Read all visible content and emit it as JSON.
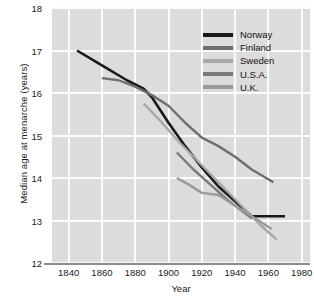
{
  "chart_data": {
    "type": "line",
    "title": "",
    "xlabel": "Year",
    "ylabel": "Median age at menarche (years)",
    "xlim": [
      1830,
      1985
    ],
    "ylim": [
      12,
      18
    ],
    "grid": true,
    "legend_position": "top-right",
    "xticks": [
      1840,
      1860,
      1880,
      1900,
      1920,
      1940,
      1960,
      1980
    ],
    "yticks": [
      12,
      13,
      14,
      15,
      16,
      17,
      18
    ],
    "series": [
      {
        "name": "Norway",
        "color": "#1a1a1a",
        "x": [
          1845,
          1860,
          1875,
          1885,
          1890,
          1900,
          1910,
          1920,
          1930,
          1940,
          1950,
          1960,
          1970
        ],
        "y": [
          17.0,
          16.65,
          16.3,
          16.1,
          15.9,
          15.3,
          14.75,
          14.25,
          13.8,
          13.45,
          13.1,
          13.1,
          13.1
        ]
      },
      {
        "name": "Finland",
        "color": "#6e6e6e",
        "x": [
          1860,
          1870,
          1880,
          1890,
          1900,
          1910,
          1920,
          1930,
          1940,
          1950,
          1963
        ],
        "y": [
          16.35,
          16.3,
          16.15,
          15.95,
          15.7,
          15.3,
          14.95,
          14.75,
          14.5,
          14.2,
          13.9
        ]
      },
      {
        "name": "Sweden",
        "color": "#a8a8a8",
        "x": [
          1885,
          1895,
          1905,
          1915,
          1925,
          1935,
          1945,
          1955,
          1965
        ],
        "y": [
          15.75,
          15.35,
          14.9,
          14.5,
          14.1,
          13.7,
          13.3,
          12.9,
          12.55
        ]
      },
      {
        "name": "U.S.A.",
        "color": "#7a7a7a",
        "x": [
          1905,
          1915,
          1925,
          1935,
          1945,
          1950
        ],
        "y": [
          14.6,
          14.2,
          13.85,
          13.5,
          13.2,
          13.05
        ]
      },
      {
        "name": "U.K.",
        "color": "#9a9a9a",
        "x": [
          1905,
          1912,
          1920,
          1930,
          1940,
          1950,
          1962
        ],
        "y": [
          14.0,
          13.85,
          13.65,
          13.6,
          13.35,
          13.1,
          12.8
        ]
      }
    ]
  },
  "legend": {
    "items": [
      {
        "label": "Norway",
        "color": "#1a1a1a"
      },
      {
        "label": "Finland",
        "color": "#6e6e6e"
      },
      {
        "label": "Sweden",
        "color": "#a8a8a8"
      },
      {
        "label": "U.S.A.",
        "color": "#7a7a7a"
      },
      {
        "label": "U.K.",
        "color": "#9a9a9a"
      }
    ]
  },
  "colors": {
    "panel_background": "#dcdcdc",
    "gridline": "#fbfbfb",
    "axis_line": "#8c8c8c",
    "page_background": "#ffffff",
    "text": "#1a1a1a"
  }
}
